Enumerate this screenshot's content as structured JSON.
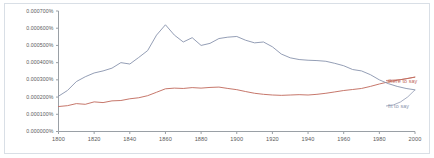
{
  "chart_data": {
    "type": "line",
    "title": "",
    "xlabel": "",
    "ylabel": "",
    "xlim": [
      1800,
      2000
    ],
    "ylim": [
      0.0,
      0.0007
    ],
    "grid": false,
    "legend_position": "right-inline",
    "x_ticks": [
      "1800",
      "1820",
      "1840",
      "1860",
      "1880",
      "1900",
      "1920",
      "1940",
      "1960",
      "1980",
      "2000"
    ],
    "x_tick_values": [
      1800,
      1820,
      1840,
      1860,
      1880,
      1900,
      1920,
      1940,
      1960,
      1980,
      2000
    ],
    "y_ticks": [
      "0.000000%",
      "0.000100%",
      "0.000200%",
      "0.000300%",
      "0.000400%",
      "0.000500%",
      "0.000600%",
      "0.000700%"
    ],
    "y_tick_values": [
      0.0,
      0.0001,
      0.0002,
      0.0003,
      0.0004,
      0.0005,
      0.0006,
      0.0007
    ],
    "x": [
      1800,
      1805,
      1810,
      1815,
      1820,
      1825,
      1830,
      1835,
      1840,
      1845,
      1850,
      1855,
      1860,
      1865,
      1870,
      1875,
      1880,
      1885,
      1890,
      1895,
      1900,
      1905,
      1910,
      1915,
      1920,
      1925,
      1930,
      1935,
      1940,
      1945,
      1950,
      1955,
      1960,
      1965,
      1970,
      1975,
      1980,
      1985,
      1990,
      1995,
      2000
    ],
    "series": [
      {
        "name": "there to say",
        "color": "#c0685a",
        "values": [
          0.000145,
          0.00015,
          0.000162,
          0.000158,
          0.000172,
          0.000168,
          0.000178,
          0.00018,
          0.00019,
          0.000196,
          0.000208,
          0.000228,
          0.000248,
          0.000252,
          0.00025,
          0.000255,
          0.000252,
          0.000256,
          0.000258,
          0.00025,
          0.000243,
          0.000232,
          0.000222,
          0.000216,
          0.000212,
          0.00021,
          0.000212,
          0.000214,
          0.000212,
          0.000216,
          0.000222,
          0.00023,
          0.000238,
          0.000244,
          0.00025,
          0.000262,
          0.000276,
          0.000288,
          0.000298,
          0.000306,
          0.000316
        ]
      },
      {
        "name": "fit to say",
        "color": "#8893ad",
        "values": [
          0.000205,
          0.000238,
          0.00029,
          0.000318,
          0.00034,
          0.000352,
          0.000368,
          0.0004,
          0.000392,
          0.00043,
          0.00047,
          0.00056,
          0.00062,
          0.00056,
          0.00052,
          0.000545,
          0.0005,
          0.000512,
          0.00054,
          0.000548,
          0.000552,
          0.00053,
          0.000515,
          0.00052,
          0.000492,
          0.00045,
          0.000428,
          0.000418,
          0.000414,
          0.000412,
          0.000408,
          0.000396,
          0.000382,
          0.00036,
          0.000352,
          0.00033,
          0.0003,
          0.000278,
          0.000262,
          0.00025,
          0.000242
        ]
      }
    ]
  }
}
